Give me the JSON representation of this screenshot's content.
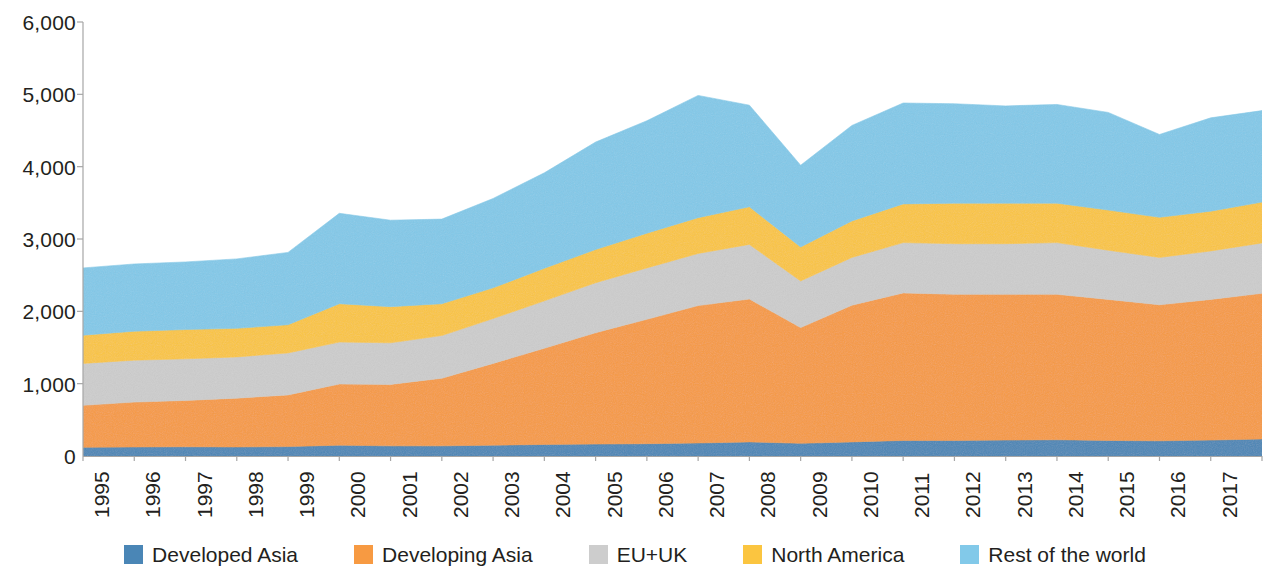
{
  "chart_data": {
    "type": "area",
    "stacked": true,
    "title": "",
    "subtitle": "",
    "xlabel": "",
    "ylabel": "",
    "grid": false,
    "legend_position": "bottom",
    "ylim": [
      0,
      6000
    ],
    "y_ticks": [
      0,
      1000,
      2000,
      3000,
      4000,
      5000,
      6000
    ],
    "y_tick_labels": [
      "0",
      "1,000",
      "2,000",
      "3,000",
      "4,000",
      "5,000",
      "6,000"
    ],
    "categories": [
      1995,
      1996,
      1997,
      1998,
      1999,
      2000,
      2001,
      2002,
      2003,
      2004,
      2005,
      2006,
      2007,
      2008,
      2009,
      2010,
      2011,
      2012,
      2013,
      2014,
      2015,
      2016,
      2017,
      2018
    ],
    "x_tick_labels": [
      "1995",
      "1996",
      "1997",
      "1998",
      "1999",
      "2000",
      "2001",
      "2002",
      "2003",
      "2004",
      "2005",
      "2006",
      "2007",
      "2008",
      "2009",
      "2010",
      "2011",
      "2012",
      "2013",
      "2014",
      "2015",
      "2016",
      "2017",
      "2018"
    ],
    "series": [
      {
        "name": "Developed Asia",
        "color": "#4a86b6",
        "values": [
          120,
          125,
          128,
          125,
          130,
          150,
          140,
          140,
          150,
          160,
          165,
          170,
          180,
          195,
          175,
          195,
          215,
          215,
          220,
          225,
          215,
          210,
          220,
          235
        ]
      },
      {
        "name": "Developing Asia",
        "color": "#f79a42",
        "values": [
          580,
          620,
          640,
          675,
          715,
          845,
          850,
          935,
          1130,
          1330,
          1540,
          1720,
          1900,
          1975,
          1600,
          1890,
          2040,
          2020,
          2015,
          2010,
          1950,
          1880,
          1945,
          2015
        ]
      },
      {
        "name": "EU+UK",
        "color": "#cdcdcd",
        "values": [
          580,
          580,
          575,
          570,
          580,
          580,
          575,
          590,
          620,
          655,
          690,
          710,
          720,
          755,
          645,
          660,
          695,
          700,
          700,
          715,
          680,
          655,
          670,
          695
        ]
      },
      {
        "name": "North America",
        "color": "#fbc540",
        "values": [
          390,
          400,
          405,
          395,
          390,
          530,
          500,
          440,
          425,
          450,
          460,
          480,
          495,
          520,
          470,
          505,
          535,
          560,
          560,
          545,
          555,
          555,
          550,
          565
        ]
      },
      {
        "name": "Rest of the world",
        "color": "#82c9e9",
        "values": [
          930,
          930,
          935,
          960,
          1000,
          1250,
          1195,
          1170,
          1235,
          1320,
          1485,
          1555,
          1690,
          1405,
          1130,
          1320,
          1395,
          1375,
          1345,
          1365,
          1350,
          1145,
          1290,
          1265
        ]
      }
    ]
  },
  "axes": {
    "y_axis_name": "value-axis",
    "x_axis_name": "year-axis"
  },
  "legend": {
    "items": [
      {
        "label": "Developed Asia",
        "color": "#4a86b6"
      },
      {
        "label": "Developing Asia",
        "color": "#f79a42"
      },
      {
        "label": "EU+UK",
        "color": "#cdcdcd"
      },
      {
        "label": "North America",
        "color": "#fbc540"
      },
      {
        "label": "Rest of the world",
        "color": "#82c9e9"
      }
    ]
  },
  "style": {
    "axis_line_color": "#a6a6a6",
    "text_color": "#231f20",
    "background": "#ffffff"
  }
}
